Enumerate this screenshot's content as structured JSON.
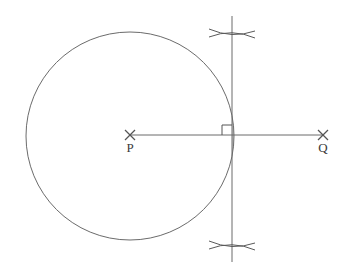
{
  "figure": {
    "type": "geometry-diagram",
    "width": 345,
    "height": 270,
    "background_color": "#ffffff"
  },
  "colors": {
    "stroke": "#6b6b6b",
    "stroke_dark": "#555555",
    "label": "#3a3a3a",
    "shade_fill": "#cccccc",
    "shade_stroke": "#b5b5b5",
    "arc_stroke": "#5a5a5a"
  },
  "points": {
    "P": {
      "label": "P",
      "marker": "x-cross-marker",
      "x": 130,
      "y": 135,
      "label_x": 130,
      "label_y": 152
    },
    "Q": {
      "label": "Q",
      "marker": "x-cross-marker",
      "x": 323,
      "y": 135,
      "label_x": 323,
      "label_y": 152
    }
  },
  "circle": {
    "name": "circle-centered-at-P",
    "center_x": 130,
    "center_y": 136,
    "radius": 104,
    "fill": "none"
  },
  "segment_pq": {
    "name": "segment-P-to-Q",
    "x1": 130,
    "y1": 135,
    "x2": 323,
    "y2": 135
  },
  "vertical_line": {
    "name": "perpendicular-bisector-line",
    "x": 232,
    "y_top": 16,
    "y_bottom": 262
  },
  "right_angle": {
    "name": "right-angle-marker",
    "vertex_x": 232,
    "vertex_y": 135,
    "size": 10,
    "opens": "up-left"
  },
  "shaded_region": {
    "name": "shaded-circular-segment",
    "chord_x": 232,
    "top_y": 82,
    "bottom_y": 190,
    "description": "circular segment between chord and arc"
  },
  "construction_arcs": [
    {
      "name": "upper-arc-pair-intersection",
      "cross_x": 232,
      "cross_y": 33,
      "span_left": 209,
      "span_right": 255
    },
    {
      "name": "lower-arc-pair-intersection",
      "cross_x": 232,
      "cross_y": 245,
      "span_left": 209,
      "span_right": 255
    }
  ]
}
